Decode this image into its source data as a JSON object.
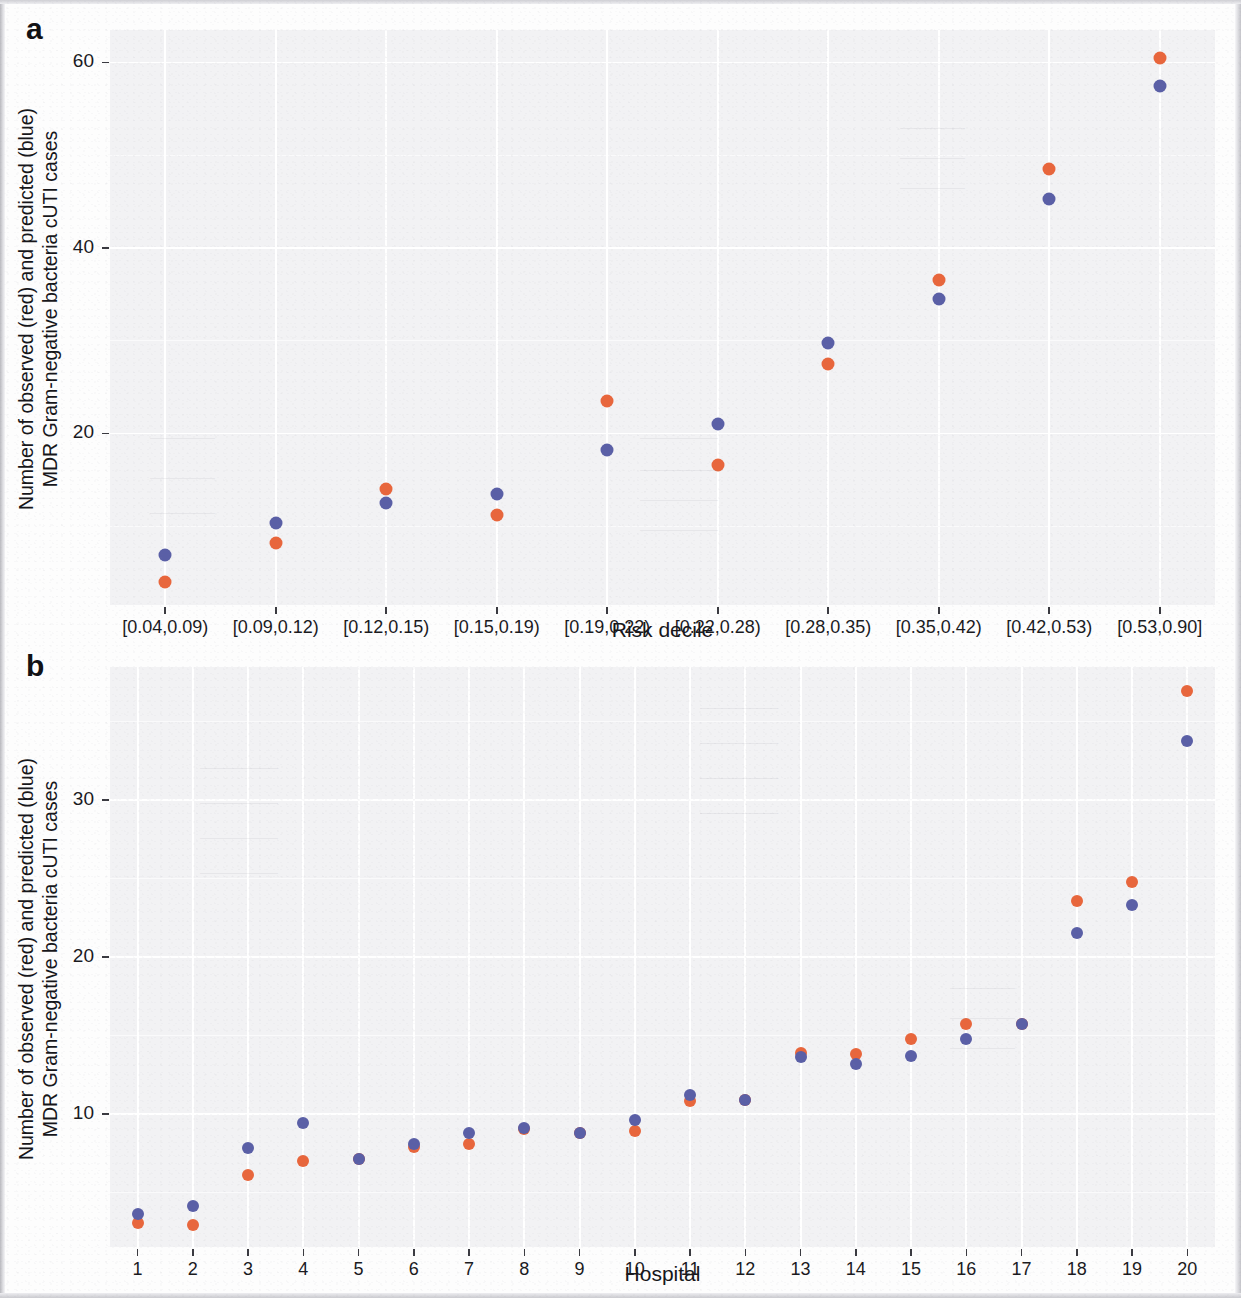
{
  "figure": {
    "panel_a_letter": "a",
    "panel_b_letter": "b",
    "observed_color": "#e8663c",
    "predicted_color": "#5a5fa6",
    "panel_background": "#f2f2f4"
  },
  "chart_data": [
    {
      "type": "scatter",
      "panel": "a",
      "title": "",
      "xlabel": "Risk decile",
      "ylabel": "Number of observed (red) and predicted (blue) MDR Gram-negative bacteria cUTI cases",
      "ylabel_line1": "Number of observed (red) and predicted (blue)",
      "ylabel_line2": "MDR Gram-negative bacteria cUTI cases",
      "categories": [
        "[0.04,0.09)",
        "[0.09,0.12)",
        "[0.12,0.15)",
        "[0.15,0.19)",
        "[0.19,0.22)",
        "[0.22,0.28)",
        "[0.28,0.35)",
        "[0.35,0.42)",
        "[0.42,0.53)",
        "[0.53,0.90]"
      ],
      "ytick_labels": [
        "20",
        "40",
        "60"
      ],
      "yticks": [
        20,
        40,
        60
      ],
      "ylim": [
        1.5,
        63.5
      ],
      "grid": true,
      "legend_position": "none",
      "series": [
        {
          "name": "Observed (red)",
          "color": "#e8663c",
          "values": [
            4.0,
            8.2,
            14.0,
            11.2,
            23.5,
            16.6,
            27.5,
            36.5,
            48.5,
            60.5
          ]
        },
        {
          "name": "Predicted (blue)",
          "color": "#5a5fa6",
          "values": [
            6.9,
            10.3,
            12.5,
            13.5,
            18.2,
            21.0,
            29.8,
            34.5,
            45.3,
            57.5
          ]
        }
      ]
    },
    {
      "type": "scatter",
      "panel": "b",
      "title": "",
      "xlabel": "Hospital",
      "ylabel": "Number of observed (red) and predicted (blue) MDR Gram-negative bacteria cUTI cases",
      "ylabel_line1": "Number of observed (red) and predicted (blue)",
      "ylabel_line2": "MDR Gram-negative bacteria cUTI cases",
      "categories": [
        "1",
        "2",
        "3",
        "4",
        "5",
        "6",
        "7",
        "8",
        "9",
        "10",
        "11",
        "12",
        "13",
        "14",
        "15",
        "16",
        "17",
        "18",
        "19",
        "20"
      ],
      "ytick_labels": [
        "10",
        "20",
        "30"
      ],
      "yticks": [
        10,
        20,
        30
      ],
      "ylim": [
        1.5,
        38.5
      ],
      "grid": true,
      "legend_position": "none",
      "series": [
        {
          "name": "Observed (red)",
          "color": "#e8663c",
          "values": [
            3.0,
            2.9,
            6.1,
            7.0,
            7.1,
            7.9,
            8.1,
            9.0,
            8.8,
            8.9,
            10.8,
            10.9,
            13.9,
            13.8,
            14.8,
            15.7,
            15.7,
            23.6,
            24.8,
            37.0
          ]
        },
        {
          "name": "Predicted (blue)",
          "color": "#5a5fa6",
          "values": [
            3.6,
            4.1,
            7.8,
            9.4,
            7.1,
            8.1,
            8.8,
            9.1,
            8.8,
            9.6,
            11.2,
            10.9,
            13.6,
            13.2,
            13.7,
            14.8,
            15.7,
            21.5,
            23.3,
            33.8
          ]
        }
      ]
    }
  ]
}
